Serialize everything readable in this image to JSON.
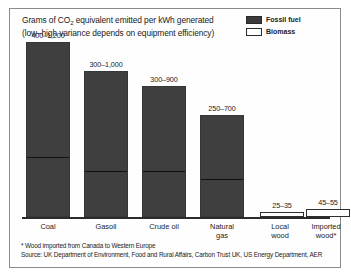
{
  "figure": {
    "title_line1_pre": "Grams of CO",
    "title_line1_sub": "2",
    "title_line1_post": " equivalent emitted per kWh generated",
    "title_line2": "(low–high variance depends on equipment efficiency)",
    "footnote": "* Wood imported from Canada to Western Europe",
    "source": "Source: UK Department of Environment, Food and Rural Affairs, Carbon Trust UK, US Energy Department, AER"
  },
  "legend": {
    "items": [
      {
        "label": "Fossil fuel",
        "type": "fossil",
        "color": "#3a3a3a"
      },
      {
        "label": "Biomass",
        "type": "biomass",
        "color": "#ffffff"
      }
    ]
  },
  "chart_data": {
    "type": "bar",
    "title": "Grams of CO2 equivalent emitted per kWh generated (low–high variance depends on equipment efficiency)",
    "xlabel": "",
    "ylabel": "Grams of CO2 equivalent per kWh",
    "ylim": [
      0,
      1200
    ],
    "grid": false,
    "legend_position": "top-right",
    "categories": [
      "Coal",
      "Gasoil",
      "Crude oil",
      "Natural gas",
      "Local wood",
      "Imported wood*"
    ],
    "category_lines": [
      [
        "Coal"
      ],
      [
        "Gasoil"
      ],
      [
        "Crude oil"
      ],
      [
        "Natural",
        "gas"
      ],
      [
        "Local",
        "wood"
      ],
      [
        "Imported",
        "wood*"
      ]
    ],
    "series": [
      {
        "name": "low",
        "values": [
          400,
          300,
          300,
          250,
          25,
          45
        ]
      },
      {
        "name": "high",
        "values": [
          1200,
          1000,
          900,
          700,
          35,
          55
        ]
      }
    ],
    "groups": [
      "fossil",
      "fossil",
      "fossil",
      "fossil",
      "biomass",
      "biomass"
    ],
    "data_labels": [
      "400–1,200",
      "300–1,000",
      "300–900",
      "250–700",
      "25–35",
      "45–55"
    ],
    "annotations": [
      "* Wood imported from Canada to Western Europe",
      "Source: UK Department of Environment, Food and Rural Affairs, Carbon Trust UK, US Energy Department, AER"
    ]
  }
}
